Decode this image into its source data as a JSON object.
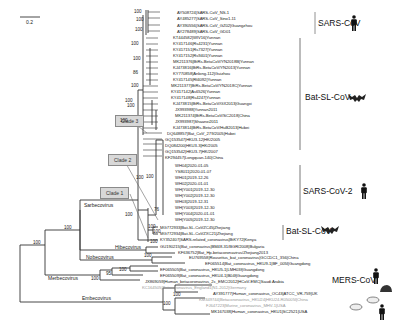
{
  "scale_bar": {
    "label": "0.2"
  },
  "groups": {
    "sars_cov": "SARS-CoV",
    "bat_sl_cov_upper": "Bat-SL-CoV",
    "sars_cov_2": "SARS-CoV-2",
    "bat_sl_cov_lower": "Bat-SL-CoV",
    "mers_cov": "MERS-CoV"
  },
  "clades": {
    "clade1": "Clade 1",
    "clade2": "Clade 2",
    "clade3": "Clade 3"
  },
  "subgenera": {
    "sarbecovirus": "Sarbecovirus",
    "hibecovirus": "Hibecovirus",
    "nobecovirus": "Nobecovirus",
    "merbecovirus": "Merbecovirus",
    "embecovirus": "Embecovirus"
  },
  "bootstrap": {
    "b1": "100",
    "b2": "100",
    "b3": "100",
    "b4": "100",
    "b5": "100",
    "b6": "86",
    "b7": "100",
    "b8": "100",
    "b9": "100",
    "b10": "100",
    "b11": "100",
    "b12": "76",
    "b13": "100",
    "b14": "100",
    "b15": "100",
    "b16": "100",
    "b17": "100",
    "b18": "100",
    "b19": "100",
    "b20": "95",
    "b21": "100",
    "b22": "100",
    "b23": "100",
    "b24": "100",
    "b25": "100"
  },
  "leaves": [
    {
      "label": "AY508724|SARS-CoV_NS-1",
      "gray": false
    },
    {
      "label": "AY485277|SARS-CoV_Sino1-11",
      "gray": false
    },
    {
      "label": "AY390556|SARS-CoV_GZ02|Guangzhou",
      "gray": false
    },
    {
      "label": "AY278489|SARS-CoV_GD01",
      "gray": false
    },
    {
      "label": "KT444582|WIV16|Yunnan",
      "gray": false
    },
    {
      "label": "KY417146|Rs4231|Yunnan",
      "gray": false
    },
    {
      "label": "KY417151|Rs7327|Yunnan",
      "gray": false
    },
    {
      "label": "KY417152|Rs9401|Yunnan",
      "gray": false
    },
    {
      "label": "MK211376|BtRs-BetaCoV/YN2018B|Yunnan",
      "gray": false
    },
    {
      "label": "KJ473816|BtRs-BetaCoV/YN2013|Yunnan",
      "gray": false
    },
    {
      "label": "KY770858|Anlong-112|Guizhou",
      "gray": false
    },
    {
      "label": "KY417145|Rf4092|Yunnan",
      "gray": false
    },
    {
      "label": "MK211377|BtRs-BetaCoV/YN2018C|Yunnan",
      "gray": false
    },
    {
      "label": "KY417142|As6526|Yunnan",
      "gray": false
    },
    {
      "label": "KY417148|Rs4247|Yunnan",
      "gray": false
    },
    {
      "label": "KJ473815|BtRs-BetaCoV/GX2013|Guangxi",
      "gray": false
    },
    {
      "label": "JX993988|Yunnan2011",
      "gray": false
    },
    {
      "label": "MK211374|BtRs-BetaCoV/SC2018|China",
      "gray": false
    },
    {
      "label": "JX993987|Shaanxi2011",
      "gray": false
    },
    {
      "label": "KJ473814|BtRs-BetaCoV/HuB2013|Hubei",
      "gray": false
    },
    {
      "label": "DQ648857|Bat_CoV_279/2005|Hubei",
      "gray": false
    },
    {
      "label": "GQ153547|HKU3-12|HK/2005",
      "gray": false
    },
    {
      "label": "DQ084200|HKU3-3|HK/2005",
      "gray": false
    },
    {
      "label": "GQ153542|HKU3-7|HK/2007",
      "gray": false
    },
    {
      "label": "KF294457|Longquan-140|China",
      "gray": false
    },
    {
      "label": "WH04|2020-01-05",
      "gray": false
    },
    {
      "label": "YS8011|2020-01-07",
      "gray": false
    },
    {
      "label": "WH01|2019-12-26",
      "gray": false
    },
    {
      "label": "WH02|2020-01-01",
      "gray": false
    },
    {
      "label": "WH|Y001|2019-12-30",
      "gray": false
    },
    {
      "label": "WH|Y002|2019-12-30",
      "gray": false
    },
    {
      "label": "WH03|2019-12-31",
      "gray": false
    },
    {
      "label": "WH|Y003|2019-12-30",
      "gray": false
    },
    {
      "label": "WH|Y004|2020-01-01",
      "gray": false
    },
    {
      "label": "WH|Y005|2019-12-30",
      "gray": false
    },
    {
      "label": "MG772933|Bat-SL-CoVZC45|Zhejiang",
      "gray": false
    },
    {
      "label": "MG772934|Bat-SL-CoVZXC21|Zhejiang",
      "gray": false
    },
    {
      "label": "KY352407|SARS-related_coronavirus|BtKY72|Kenya",
      "gray": false
    },
    {
      "label": "GU190215|Bat_coronavirus|BM48-31/BGR/2008|Bulgaria",
      "gray": false
    },
    {
      "label": "KF636752|Bat_Hp-betacoronavirus/Zhejiang2013",
      "gray": false
    },
    {
      "label": "EU769558|Rousettus_bat_coronavirus|GCCDC1_356|China",
      "gray": false
    },
    {
      "label": "EF065514|Bat_coronavirus_HKU9-1|BF_005I|Guangdong",
      "gray": false
    },
    {
      "label": "EF065505|Bat_coronavirus_HKU5-1|LMH03f|Guangdong",
      "gray": false
    },
    {
      "label": "EF065509|Bat_coronavirus_HKU4-1|B04f|Guangdong",
      "gray": false
    },
    {
      "label": "JX869059|Human_betacoronavirus_2c_EMC/2012|HCoV-EMC|Saudi Arabia",
      "gray": false
    },
    {
      "label": "KC164505|Betacoronavirus_England1|N1-2012|Germany",
      "gray": true
    },
    {
      "label": "AY391777|Human_coronavirus_OC43|ATCC_VR-759|UK",
      "gray": false
    },
    {
      "label": "KM349744|Betacoronavirus_HKU24|HKU24-R05005I|China",
      "gray": true
    },
    {
      "label": "FJ647223|Murine_coronavirus_MHV-1|USA",
      "gray": true
    },
    {
      "label": "MK167038|Human_coronavirus_HKU1|SC2521|USA",
      "gray": false
    }
  ],
  "icons": {
    "sars_cov": "human-icon",
    "bat_upper": "bat-icon",
    "sars_cov_2": "human-icon",
    "bat_lower": "bat-icon",
    "mers_human": "human-icon",
    "mers_hedgehog": "hedgehog-icon",
    "mouse_upper": "rodent-icon",
    "mouse_lower": "rodent-icon",
    "hku1_human": "human-icon"
  }
}
